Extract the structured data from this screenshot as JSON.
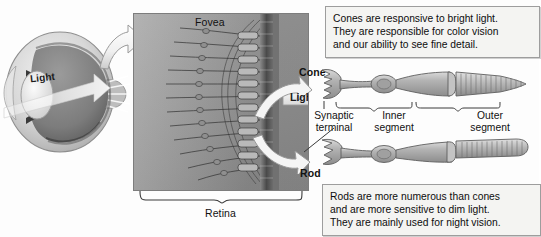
{
  "figure": {
    "background_color": "#ffffff"
  },
  "eye_diagram": {
    "name": "human-eye-cross-section",
    "light_label": "Light",
    "description": "Sagittal cross-section of the human eye showing light entering through the lens toward the retina"
  },
  "retina_panel": {
    "background_color": "#9a9a9a",
    "fovea_label": "Fovea",
    "retina_label": "Retina",
    "light_label": "Light",
    "description": "Magnified view of the retina at the fovea showing photoreceptor cells and their neural connections"
  },
  "cell_diagram": {
    "cone_label": "Cone",
    "rod_label": "Rod",
    "segments": [
      {
        "id": "synaptic-terminal",
        "line1": "Synaptic",
        "line2": "terminal"
      },
      {
        "id": "inner-segment",
        "line1": "Inner",
        "line2": "segment"
      },
      {
        "id": "outer-segment",
        "line1": "Outer",
        "line2": "segment"
      }
    ]
  },
  "callouts": {
    "cone": {
      "lines": [
        "Cones are responsive to bright light.",
        "They are responsible for color vision",
        "and our ability to see fine detail."
      ],
      "text": "Cones are responsive to bright light. They are responsible for color vision and our ability to see fine detail."
    },
    "rod": {
      "lines": [
        "Rods are more numerous than cones",
        "and are more sensitive to dim light.",
        "They are mainly used for night vision."
      ],
      "text": "Rods are more numerous than cones and are more sensitive to dim light. They are mainly used for night vision."
    }
  },
  "arrows": {
    "eye_to_retina": "magnify-arrow",
    "retina_to_cone": "curved-arrow-cone",
    "retina_to_rod": "curved-arrow-rod"
  }
}
